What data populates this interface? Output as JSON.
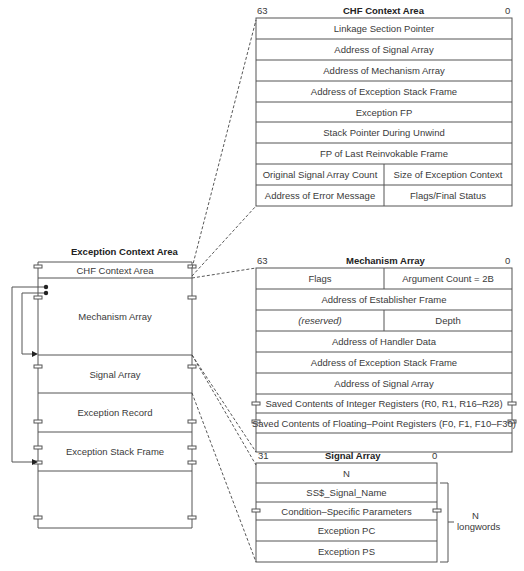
{
  "left": {
    "title": "Exception Context Area",
    "segments": [
      {
        "label": "CHF Context Area"
      },
      {
        "label": "Mechanism Array"
      },
      {
        "label": "Signal Array"
      },
      {
        "label": "Exception Record"
      },
      {
        "label": "Exception Stack Frame"
      }
    ]
  },
  "chf": {
    "title": "CHF Context Area",
    "bit_high": "63",
    "bit_low": "0",
    "rows": [
      {
        "label": "Linkage Section Pointer"
      },
      {
        "label": "Address of Signal Array"
      },
      {
        "label": "Address of Mechanism Array"
      },
      {
        "label": "Address of Exception Stack Frame"
      },
      {
        "label": "Exception FP"
      },
      {
        "label": "Stack Pointer During Unwind"
      },
      {
        "label": "FP of Last Reinvokable Frame"
      },
      {
        "left": "Original Signal Array Count",
        "right": "Size of Exception Context"
      },
      {
        "left": "Address of Error Message",
        "right": "Flags/Final Status"
      }
    ]
  },
  "mech": {
    "title": "Mechanism Array",
    "bit_high": "63",
    "bit_low": "0",
    "rows": [
      {
        "left": "Flags",
        "right": "Argument Count = 2B"
      },
      {
        "label": "Address of Establisher Frame"
      },
      {
        "left": "(reserved)",
        "right": "Depth"
      },
      {
        "label": "Address of Handler Data"
      },
      {
        "label": "Address of Exception Stack Frame"
      },
      {
        "label": "Address of Signal Array"
      },
      {
        "label": "Saved Contents of Integer Registers (R0, R1, R16–R28)"
      },
      {
        "label": "Saved Contents of Floating–Point Registers (F0, F1, F10–F30)"
      }
    ]
  },
  "sig": {
    "title": "Signal Array",
    "bit_high": "31",
    "bit_low": "0",
    "rows": [
      {
        "label": "N"
      },
      {
        "label": "SS$_Signal_Name"
      },
      {
        "label": "Condition–Specific Parameters"
      },
      {
        "label": "Exception PC"
      },
      {
        "label": "Exception PS"
      }
    ],
    "brace_label_1": "N",
    "brace_label_2": "longwords"
  },
  "colors": {
    "line": "#555555",
    "text": "#3a3a3a"
  }
}
